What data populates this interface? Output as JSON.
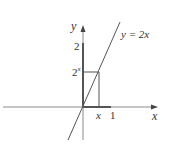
{
  "diagram": {
    "title": "",
    "colors": {
      "axis": "#8a8a8a",
      "line": "#555555",
      "thick": "#555555",
      "text": "#333333",
      "background": "#ffffff"
    },
    "axes": {
      "x_label": "x",
      "y_label": "y"
    },
    "curve": {
      "label": "y = 2x",
      "equation": "y = 2x"
    },
    "labels": {
      "y_tick_2": "2",
      "y_tick_2x_base": "2",
      "y_tick_2x_exp": "x",
      "x_tick_x": "x",
      "x_tick_1": "1"
    },
    "elements": [
      "x-axis with arrow",
      "y-axis with arrow",
      "line y = 2x through origin",
      "thick segment on y-axis from 0 to 2",
      "thick segment on x-axis from 0 to 1",
      "rectangle from (0,0) to (x, 2x)"
    ]
  }
}
